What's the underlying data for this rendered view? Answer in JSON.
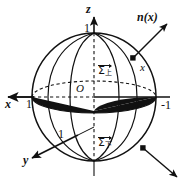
{
  "figure": {
    "kind": "unit-sphere-oriented-surface-diagram",
    "background": "#ffffff",
    "ink": "#111111",
    "fill_disk": "#111111"
  },
  "axes": {
    "z": {
      "label": "z",
      "tick_label": "1",
      "direction": "up"
    },
    "x": {
      "label": "x",
      "tick_label": "1",
      "direction": "left"
    },
    "y": {
      "label": "y",
      "tick_label": "1",
      "direction": "down-left"
    },
    "right_tick_label": "-1",
    "origin_label": "O"
  },
  "surfaces": {
    "upper": {
      "symbol": "Σ",
      "subscript": "上",
      "oriented": true
    },
    "lower": {
      "symbol": "Σ",
      "subscript": "下",
      "oriented": true
    }
  },
  "region": {
    "label": "Δ",
    "description": "shaded elliptical disk"
  },
  "vectors": [
    {
      "name": "normal-upper",
      "label": "n(x)",
      "from": [
        133,
        58
      ],
      "to": [
        168,
        22
      ]
    },
    {
      "name": "normal-lower",
      "label": "",
      "from": [
        143,
        148
      ],
      "to": [
        176,
        176
      ]
    }
  ],
  "points": [
    {
      "name": "point-x",
      "label": "x",
      "at": [
        133,
        58
      ]
    },
    {
      "name": "point-lower",
      "label": "",
      "at": [
        143,
        148
      ]
    }
  ]
}
